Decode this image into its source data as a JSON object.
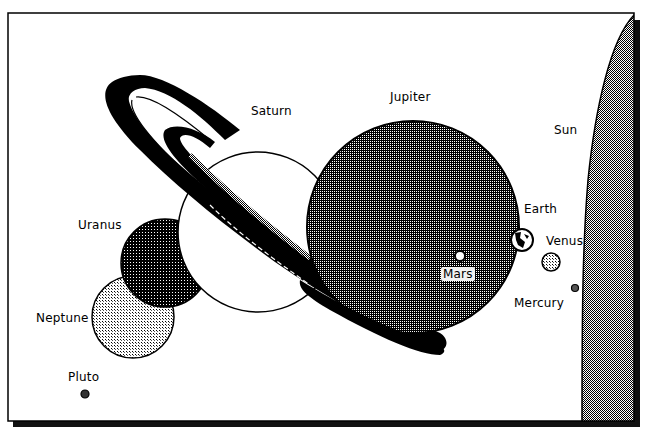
{
  "colors": {
    "background": "#ffffff",
    "outline": "#000000",
    "jupiter": "#6a6a6a",
    "sun": "#7a7a7a",
    "uranus": "#4e4e4e",
    "neptune": "#b8b8b8",
    "saturn_body": "#ffffff",
    "venus": "#cfcfcf",
    "shadow": "#111111"
  },
  "bodies": [
    {
      "id": "sun",
      "label": "Sun"
    },
    {
      "id": "mercury",
      "label": "Mercury"
    },
    {
      "id": "venus",
      "label": "Venus"
    },
    {
      "id": "earth",
      "label": "Earth"
    },
    {
      "id": "mars",
      "label": "Mars"
    },
    {
      "id": "jupiter",
      "label": "Jupiter"
    },
    {
      "id": "saturn",
      "label": "Saturn"
    },
    {
      "id": "uranus",
      "label": "Uranus"
    },
    {
      "id": "neptune",
      "label": "Neptune"
    },
    {
      "id": "pluto",
      "label": "Pluto"
    }
  ],
  "labels": {
    "sun": "Sun",
    "mercury": "Mercury",
    "venus": "Venus",
    "earth": "Earth",
    "mars": "Mars",
    "jupiter": "Jupiter",
    "saturn": "Saturn",
    "uranus": "Uranus",
    "neptune": "Neptune",
    "pluto": "Pluto"
  }
}
